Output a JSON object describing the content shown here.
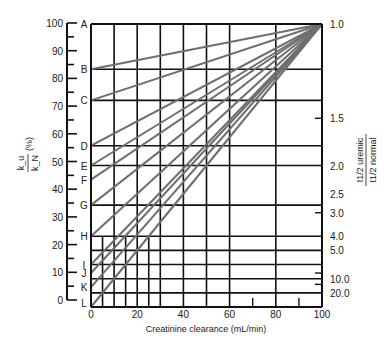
{
  "chart_data": {
    "type": "line",
    "title": "",
    "xlabel": "Creatinine clearance (mL/min)",
    "ylabel": "k_u / k_N (%)",
    "ylabel_parts": {
      "numerator": "k_u",
      "denominator": "k_N",
      "unit": "(%)"
    },
    "y2label": "t1/2 uremic / t1/2 normal",
    "y2label_parts": {
      "numerator": "t1/2 uremic",
      "denominator": "t1/2 normal"
    },
    "xlim": [
      0,
      100
    ],
    "ylim": [
      0,
      100
    ],
    "x_ticks": [
      0,
      20,
      40,
      60,
      80,
      100
    ],
    "x_tick_labels": [
      "0",
      "20",
      "40",
      "60",
      "80",
      "100"
    ],
    "y_ticks": [
      0,
      10,
      20,
      30,
      40,
      50,
      60,
      70,
      80,
      90,
      100
    ],
    "y_tick_labels": [
      "0",
      "10",
      "20",
      "30",
      "40",
      "50",
      "60",
      "70",
      "80",
      "90",
      "100"
    ],
    "y2_ticks": [
      {
        "label": "1.0",
        "y": 100
      },
      {
        "label": "1.5",
        "y": 66.7
      },
      {
        "label": "2.0",
        "y": 50
      },
      {
        "label": "2.5",
        "y": 40
      },
      {
        "label": "3.0",
        "y": 33.3
      },
      {
        "label": "4.0",
        "y": 25
      },
      {
        "label": "5.0",
        "y": 20
      },
      {
        "label": "10.0",
        "y": 10
      },
      {
        "label": "20.0",
        "y": 5
      }
    ],
    "grid": true,
    "legend": "none",
    "group_labels": [
      "A",
      "B",
      "C",
      "D",
      "E",
      "F",
      "G",
      "H",
      "I",
      "J",
      "K",
      "L"
    ],
    "series": [
      {
        "name": "A",
        "x": [
          0,
          100
        ],
        "y": [
          100,
          100
        ]
      },
      {
        "name": "B",
        "x": [
          0,
          100
        ],
        "y": [
          84,
          100
        ]
      },
      {
        "name": "C",
        "x": [
          0,
          100
        ],
        "y": [
          73,
          100
        ]
      },
      {
        "name": "D",
        "x": [
          0,
          100
        ],
        "y": [
          57,
          100
        ]
      },
      {
        "name": "E",
        "x": [
          0,
          100
        ],
        "y": [
          50,
          100
        ]
      },
      {
        "name": "F",
        "x": [
          0,
          100
        ],
        "y": [
          45,
          100
        ]
      },
      {
        "name": "G",
        "x": [
          0,
          100
        ],
        "y": [
          36,
          100
        ]
      },
      {
        "name": "H",
        "x": [
          0,
          100
        ],
        "y": [
          25,
          100
        ]
      },
      {
        "name": "I",
        "x": [
          0,
          100
        ],
        "y": [
          15,
          100
        ]
      },
      {
        "name": "J",
        "x": [
          0,
          100
        ],
        "y": [
          12,
          100
        ]
      },
      {
        "name": "K",
        "x": [
          0,
          100
        ],
        "y": [
          7,
          100
        ]
      },
      {
        "name": "L",
        "x": [
          0,
          100
        ],
        "y": [
          0,
          100
        ]
      }
    ],
    "line_color": "#6e6e6e",
    "grid_color": "#111111"
  }
}
